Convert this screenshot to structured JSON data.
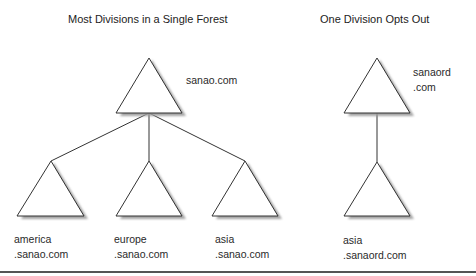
{
  "titles": {
    "left": "Most Divisions in a Single Forest",
    "right": "One Division Opts Out"
  },
  "left_tree": {
    "root": {
      "name": "sanao.com"
    },
    "children": [
      {
        "line1": "america",
        "line2": ".sanao.com"
      },
      {
        "line1": "europe",
        "line2": ".sanao.com"
      },
      {
        "line1": "asia",
        "line2": ".sanao.com"
      }
    ]
  },
  "right_tree": {
    "root": {
      "line1": "sanaord",
      "line2": ".com"
    },
    "child": {
      "line1": "asia",
      "line2": ".sanaord.com"
    }
  },
  "colors": {
    "stroke": "#333333",
    "shadow": "#9a9a9a",
    "rule": "#555555"
  }
}
